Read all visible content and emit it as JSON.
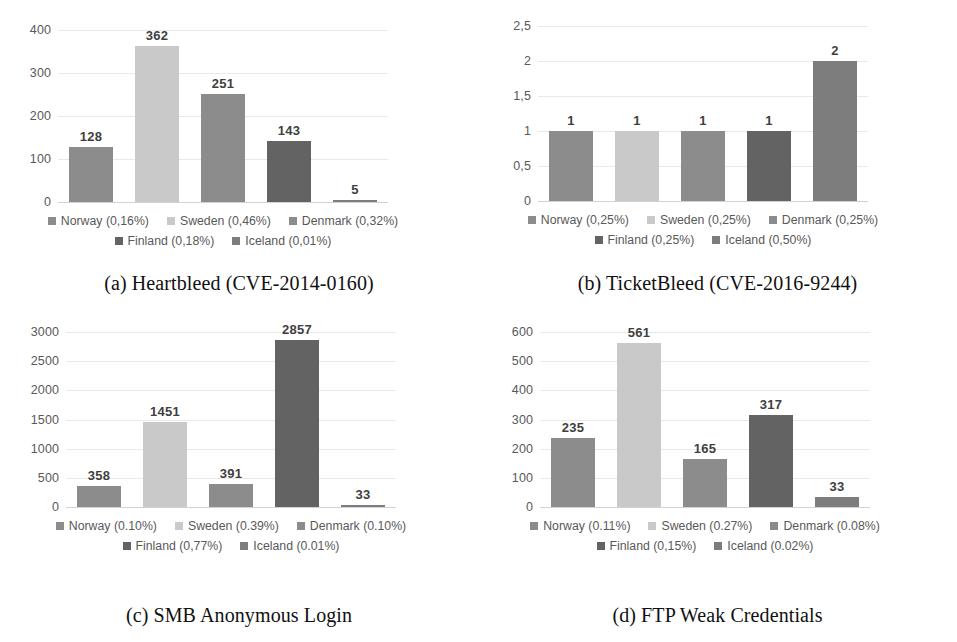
{
  "figure": {
    "countries": [
      "Norway",
      "Sweden",
      "Denmark",
      "Finland",
      "Iceland"
    ],
    "colors": {
      "Norway": "#8c8c8c",
      "Sweden": "#c9c9c9",
      "Denmark": "#8c8c8c",
      "Finland": "#636363",
      "Iceland": "#7d7d7d"
    }
  },
  "chart_data": [
    {
      "type": "bar",
      "panel": "a",
      "title": "(a) Heartbleed (CVE-2014-0160)",
      "categories": [
        "Norway",
        "Sweden",
        "Denmark",
        "Finland",
        "Iceland"
      ],
      "values": [
        128,
        362,
        251,
        143,
        5
      ],
      "value_labels": [
        "128",
        "362",
        "251",
        "143",
        "5"
      ],
      "yticks": [
        "400",
        "300",
        "200",
        "100",
        "0"
      ],
      "ytick_values": [
        400,
        300,
        200,
        100,
        0
      ],
      "ylim": [
        0,
        400
      ],
      "xlabel": "",
      "ylabel": "",
      "grid": true,
      "legend_position": "bottom",
      "legend": [
        "Norway (0,16%)",
        "Sweden (0,46%)",
        "Denmark (0,32%)",
        "Finland (0,18%)",
        "Iceland (0,01%)"
      ]
    },
    {
      "type": "bar",
      "panel": "b",
      "title": "(b) TicketBleed (CVE-2016-9244)",
      "categories": [
        "Norway",
        "Sweden",
        "Denmark",
        "Finland",
        "Iceland"
      ],
      "values": [
        1,
        1,
        1,
        1,
        2
      ],
      "value_labels": [
        "1",
        "1",
        "1",
        "1",
        "2"
      ],
      "yticks": [
        "2,5",
        "2",
        "1,5",
        "1",
        "0,5",
        "0"
      ],
      "ytick_values": [
        2.5,
        2,
        1.5,
        1,
        0.5,
        0
      ],
      "ylim": [
        0,
        2.5
      ],
      "xlabel": "",
      "ylabel": "",
      "grid": true,
      "legend_position": "bottom",
      "legend": [
        "Norway (0,25%)",
        "Sweden (0,25%)",
        "Denmark (0,25%)",
        "Finland (0,25%)",
        "Iceland (0,50%)"
      ]
    },
    {
      "type": "bar",
      "panel": "c",
      "title": "(c) SMB Anonymous Login",
      "categories": [
        "Norway",
        "Sweden",
        "Denmark",
        "Finland",
        "Iceland"
      ],
      "values": [
        358,
        1451,
        391,
        2857,
        33
      ],
      "value_labels": [
        "358",
        "1451",
        "391",
        "2857",
        "33"
      ],
      "yticks": [
        "3000",
        "2500",
        "2000",
        "1500",
        "1000",
        "500",
        "0"
      ],
      "ytick_values": [
        3000,
        2500,
        2000,
        1500,
        1000,
        500,
        0
      ],
      "ylim": [
        0,
        3000
      ],
      "xlabel": "",
      "ylabel": "",
      "grid": true,
      "legend_position": "bottom",
      "legend": [
        "Norway (0.10%)",
        "Sweden (0.39%)",
        "Denmark (0.10%)",
        "Finland (0,77%)",
        "Iceland (0.01%)"
      ]
    },
    {
      "type": "bar",
      "panel": "d",
      "title": "(d) FTP Weak Credentials",
      "categories": [
        "Norway",
        "Sweden",
        "Denmark",
        "Finland",
        "Iceland"
      ],
      "values": [
        235,
        561,
        165,
        317,
        33
      ],
      "value_labels": [
        "235",
        "561",
        "165",
        "317",
        "33"
      ],
      "yticks": [
        "600",
        "500",
        "400",
        "300",
        "200",
        "100",
        "0"
      ],
      "ytick_values": [
        600,
        500,
        400,
        300,
        200,
        100,
        0
      ],
      "ylim": [
        0,
        600
      ],
      "xlabel": "",
      "ylabel": "",
      "grid": true,
      "legend_position": "bottom",
      "legend": [
        "Norway (0.11%)",
        "Sweden (0.27%)",
        "Denmark (0.08%)",
        "Finland (0,15%)",
        "Iceland (0.02%)"
      ]
    }
  ]
}
